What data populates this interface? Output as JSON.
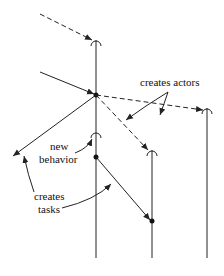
{
  "diagram": {
    "type": "actor-creation-timeline",
    "colors": {
      "line": "#222222",
      "background": "#ffffff"
    },
    "labels": {
      "creates_actors": "creates actors",
      "new_behavior_line1": "new",
      "new_behavior_line2": "behavior",
      "creates_tasks_line1": "creates",
      "creates_tasks_line2": "tasks"
    },
    "lifelines": [
      {
        "id": "actor-main",
        "x": 96
      },
      {
        "id": "actor-2",
        "x": 152
      },
      {
        "id": "actor-3",
        "x": 207
      }
    ]
  }
}
